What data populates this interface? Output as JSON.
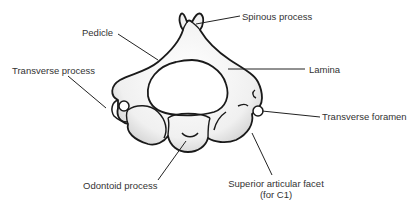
{
  "diagram": {
    "colors": {
      "outline": "#1a1a1a",
      "fill": "#f2f2f2",
      "shade": "#d6d6d6",
      "text": "#333333",
      "leader": "#222222"
    },
    "labels": {
      "spinous_process": "Spinous process",
      "pedicle": "Pedicle",
      "lamina": "Lamina",
      "transverse_process": "Transverse process",
      "transverse_foramen": "Transverse foramen",
      "odontoid_process": "Odontoid process",
      "superior_articular_facet_line1": "Superior articular facet",
      "superior_articular_facet_line2": "(for C1)"
    }
  }
}
